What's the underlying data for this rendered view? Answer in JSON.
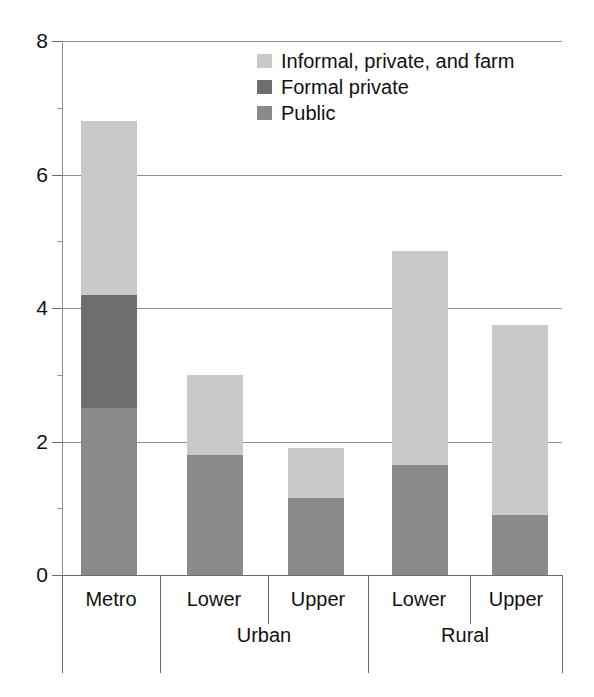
{
  "chart_data": {
    "type": "bar",
    "subtype": "stacked",
    "title": "",
    "xlabel": "",
    "ylabel": "",
    "ylim": [
      0,
      8
    ],
    "yticks": [
      0,
      2,
      4,
      6,
      8
    ],
    "ytick_labels": [
      "0",
      "2",
      "4",
      "6",
      "8"
    ],
    "grid": true,
    "grid_axis": "y",
    "legend_position": "top-center",
    "categories": [
      "Metro",
      "Lower",
      "Upper",
      "Lower",
      "Upper"
    ],
    "category_groups": [
      {
        "label": "",
        "spans": [
          "Metro"
        ]
      },
      {
        "label": "Urban",
        "spans": [
          "Lower",
          "Upper"
        ]
      },
      {
        "label": "Rural",
        "spans": [
          "Lower",
          "Upper"
        ]
      }
    ],
    "series": [
      {
        "name": "Public",
        "color": "#8a8a8a",
        "values": [
          2.5,
          1.8,
          1.15,
          1.65,
          0.9
        ]
      },
      {
        "name": "Formal private",
        "color": "#6e6e6e",
        "values": [
          1.7,
          0.0,
          0.0,
          0.0,
          0.0
        ]
      },
      {
        "name": "Informal, private, and farm",
        "color": "#c9c9c9",
        "values": [
          2.6,
          1.2,
          0.75,
          3.2,
          2.85
        ]
      }
    ],
    "totals": [
      6.8,
      3.0,
      1.9,
      4.85,
      3.75
    ]
  },
  "legend": {
    "items": [
      {
        "label": "Informal, private, and farm",
        "color": "#c9c9c9"
      },
      {
        "label": "Formal private",
        "color": "#6e6e6e"
      },
      {
        "label": "Public",
        "color": "#8a8a8a"
      }
    ]
  },
  "axis": {
    "y_labels": [
      "8",
      "6",
      "4",
      "2",
      "0"
    ]
  },
  "categories": {
    "row1": [
      "Metro",
      "Lower",
      "Upper",
      "Lower",
      "Upper"
    ],
    "row2": [
      "Urban",
      "Rural"
    ]
  },
  "colors": {
    "informal": "#c9c9c9",
    "formal_private": "#6e6e6e",
    "public": "#8a8a8a",
    "gridline": "#8e8e8e",
    "axis": "#6b6b6b",
    "text": "#111111",
    "background": "#ffffff"
  }
}
